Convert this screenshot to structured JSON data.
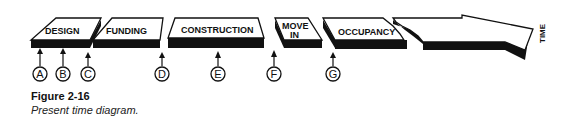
{
  "diagram": {
    "phases": [
      {
        "id": "design",
        "label": "DESIGN"
      },
      {
        "id": "funding",
        "label": "FUNDING"
      },
      {
        "id": "construction",
        "label": "CONSTRUCTION"
      },
      {
        "id": "move-in",
        "label_line1": "MOVE",
        "label_line2": "IN"
      },
      {
        "id": "occupancy",
        "label": "OCCUPANCY"
      }
    ],
    "time_arrow_label": "TIME",
    "markers": [
      "A",
      "B",
      "C",
      "D",
      "E",
      "F",
      "G"
    ]
  },
  "caption": {
    "title": "Figure 2-16",
    "text": "Present time diagram."
  }
}
